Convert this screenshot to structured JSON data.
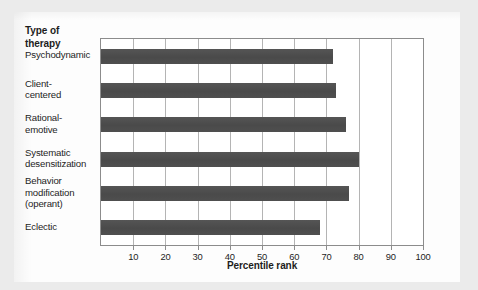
{
  "chart_data": {
    "type": "bar",
    "orientation": "horizontal",
    "title": "",
    "xlabel": "Percentile rank",
    "ylabel": "Type of therapy",
    "xlim": [
      0,
      100
    ],
    "xticks": [
      10,
      20,
      30,
      40,
      50,
      60,
      70,
      80,
      90,
      100
    ],
    "xticklabels": [
      "10",
      "20",
      "30",
      "40",
      "50",
      "60",
      "70",
      "80",
      "90",
      "100"
    ],
    "grid": "vertical",
    "legend": null,
    "bar_color": "#4d4d4d",
    "categories": [
      "Psychodynamic",
      "Client-centered",
      "Rational-emotive",
      "Systematic desensitization",
      "Behavior modification (operant)",
      "Eclectic"
    ],
    "category_label_lines": [
      [
        "Psychodynamic"
      ],
      [
        "Client-",
        "centered"
      ],
      [
        "Rational-",
        "emotive"
      ],
      [
        "Systematic",
        "desensitization"
      ],
      [
        "Behavior",
        "modification",
        "(operant)"
      ],
      [
        "Eclectic"
      ]
    ],
    "values": [
      72,
      73,
      76,
      80,
      77,
      68
    ]
  },
  "axis": {
    "y_title": "Type of\ntherapy",
    "y_title_line1": "Type of",
    "y_title_line2": "therapy",
    "x_title": "Percentile rank"
  }
}
